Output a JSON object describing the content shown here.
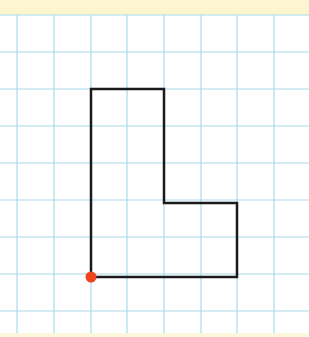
{
  "canvas": {
    "width": 309,
    "height": 337
  },
  "colors": {
    "top_band": "#fdf5cf",
    "bottom_band": "#fdf8dc",
    "paper": "#ffffff",
    "grid_line": "#a9dcea",
    "shape_stroke": "#1a1a1a",
    "point": "#f0441e"
  },
  "grid": {
    "top": 15,
    "bottom": 333,
    "vertical_x": [
      17,
      54,
      91,
      127,
      164,
      201,
      237,
      274
    ],
    "horizontal_y": [
      15,
      52,
      89,
      126,
      163,
      200,
      237,
      274,
      311
    ]
  },
  "shape": {
    "type": "L-polygon",
    "points": [
      [
        91,
        89
      ],
      [
        164,
        89
      ],
      [
        164,
        203
      ],
      [
        237,
        203
      ],
      [
        237,
        277
      ],
      [
        91,
        277
      ]
    ]
  },
  "point": {
    "label": "start-vertex",
    "x": 91,
    "y": 277,
    "r": 5.5
  }
}
